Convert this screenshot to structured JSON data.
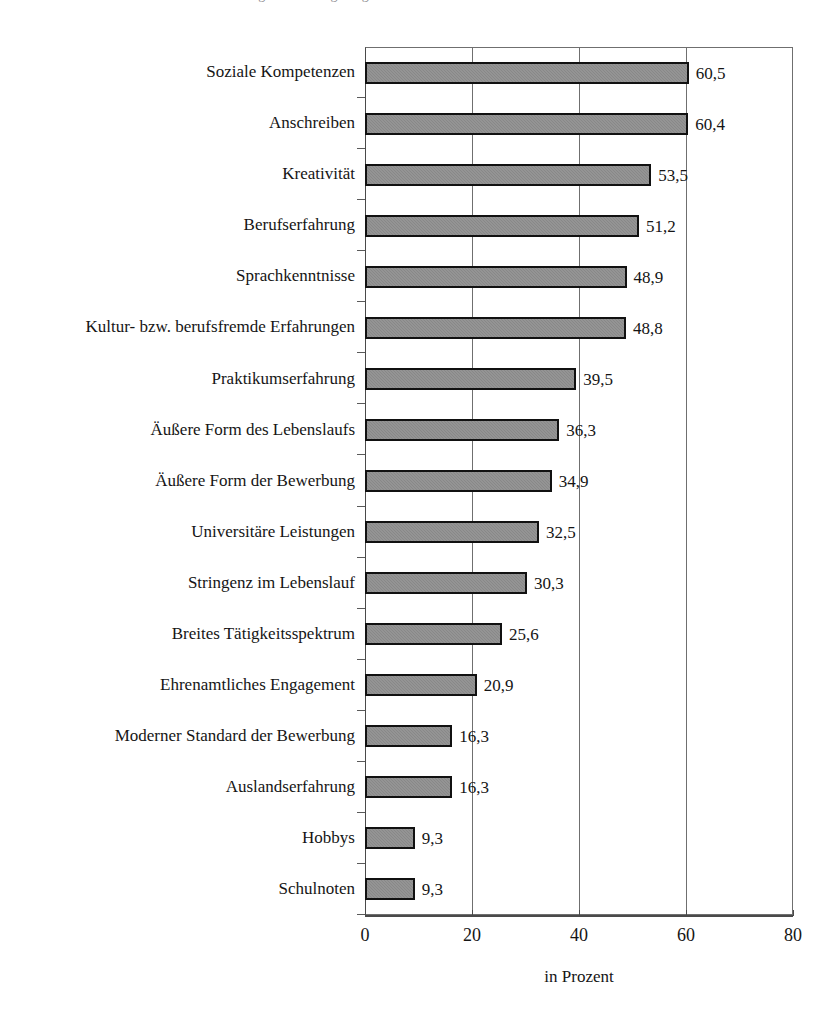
{
  "header": {
    "cropped_caption_ghost": "Abbildung: Bedeutung ausgewählter Kriterien bei der Bewerberauswahl"
  },
  "chart_data": {
    "type": "bar",
    "orientation": "horizontal",
    "title": "",
    "subtitle": "",
    "xlabel": "in Prozent",
    "ylabel": "",
    "xlim": [
      0,
      80
    ],
    "xticks": [
      0,
      20,
      40,
      60,
      80
    ],
    "xtick_labels": [
      "0",
      "20",
      "40",
      "60",
      "80"
    ],
    "grid": "vertical",
    "legend": "none",
    "decimal_separator": ",",
    "bar_fill_color": "#8f8f8f",
    "bar_border_color": "#111111",
    "axis_color": "#4a4a4a",
    "grid_color": "#6f6f6f",
    "categories": [
      "Soziale Kompetenzen",
      "Anschreiben",
      "Kreativität",
      "Berufserfahrung",
      "Sprachkenntnisse",
      "Kultur- bzw. berufsfremde Erfahrungen",
      "Praktikumserfahrung",
      "Äußere Form des Lebenslaufs",
      "Äußere Form der Bewerbung",
      "Universitäre Leistungen",
      "Stringenz im Lebenslauf",
      "Breites Tätigkeitsspektrum",
      "Ehrenamtliches Engagement",
      "Moderner Standard der Bewerbung",
      "Auslandserfahrung",
      "Hobbys",
      "Schulnoten"
    ],
    "values": [
      60.5,
      60.4,
      53.5,
      51.2,
      48.9,
      48.8,
      39.5,
      36.3,
      34.9,
      32.5,
      30.3,
      25.6,
      20.9,
      16.3,
      16.3,
      9.3,
      9.3
    ],
    "value_labels": [
      "60,5",
      "60,4",
      "53,5",
      "51,2",
      "48,9",
      "48,8",
      "39,5",
      "36,3",
      "34,9",
      "32,5",
      "30,3",
      "25,6",
      "20,9",
      "16,3",
      "16,3",
      "9,3",
      "9,3"
    ]
  }
}
